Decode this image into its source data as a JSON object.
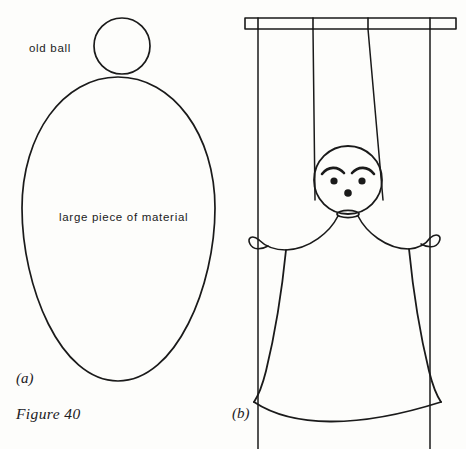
{
  "figure": {
    "caption": "Figure 40",
    "panel_a_label": "(a)",
    "panel_b_label": "(b)",
    "stroke_color": "#1a1a1a",
    "background_color": "#fdfdfb"
  },
  "panel_a": {
    "name": "materials-layout",
    "annotations": [
      {
        "key": "ball",
        "text": "old ball"
      },
      {
        "key": "material",
        "text": "large piece of material"
      }
    ],
    "shapes": [
      {
        "name": "old-ball-circle",
        "type": "circle",
        "cx": 122,
        "cy": 46,
        "r": 28
      },
      {
        "name": "material-ellipse",
        "type": "ellipse",
        "cx": 118,
        "cy": 230,
        "rx": 97,
        "ry": 153
      }
    ]
  },
  "panel_b": {
    "name": "finished-puppet",
    "control_bar": {
      "name": "control-bar",
      "x": 245,
      "y": 18,
      "width": 211,
      "height": 11,
      "tick_count": 4
    },
    "strings": [
      {
        "name": "string-left-outer",
        "x": 258,
        "top": 29,
        "bottom": 449
      },
      {
        "name": "string-left-inner",
        "x": 313,
        "top": 29,
        "bottom": 240
      },
      {
        "name": "string-right-inner",
        "x": 368,
        "top": 29,
        "bottom": 240
      },
      {
        "name": "string-right-outer",
        "x": 430,
        "top": 29,
        "bottom": 449
      }
    ],
    "puppet": {
      "head": {
        "name": "puppet-head",
        "cx": 348,
        "cy": 180,
        "r": 34
      },
      "face": {
        "eyes": [
          {
            "name": "eye-left",
            "cx": 334,
            "cy": 180,
            "r": 3.6
          },
          {
            "name": "eye-right",
            "cx": 362,
            "cy": 180,
            "r": 3.6
          }
        ],
        "eyebrows": [
          {
            "name": "eyebrow-left"
          },
          {
            "name": "eyebrow-right"
          }
        ],
        "nose": {
          "name": "nose",
          "cx": 348,
          "cy": 192,
          "r": 3.6
        }
      },
      "collar": {
        "name": "neck-collar",
        "cx": 348,
        "cy": 214,
        "rx": 11,
        "ry": 3.5
      },
      "arms": [
        {
          "name": "arm-left"
        },
        {
          "name": "arm-right"
        }
      ],
      "hands": [
        {
          "name": "hand-loop-left",
          "cx": 258,
          "cy": 240
        },
        {
          "name": "hand-loop-right",
          "cx": 430,
          "cy": 238
        }
      ],
      "skirt": {
        "name": "puppet-skirt"
      }
    }
  }
}
